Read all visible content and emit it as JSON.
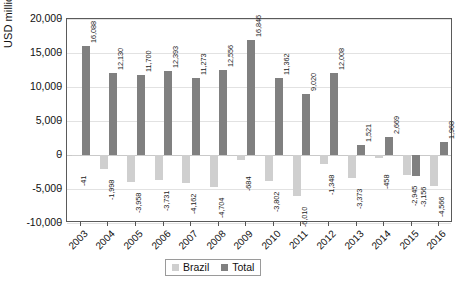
{
  "chart_data": {
    "type": "bar",
    "title": "",
    "xlabel": "",
    "ylabel": "USD millions",
    "ylim": [
      -10000,
      20000
    ],
    "yticks": [
      20000,
      15000,
      10000,
      5000,
      0,
      -5000,
      -10000
    ],
    "ytick_labels": [
      "20,000",
      "15,000",
      "10,000",
      "5,000",
      "0",
      "-5,000",
      "-10,000"
    ],
    "grid": true,
    "legend_position": "bottom-center",
    "categories": [
      "2003",
      "2004",
      "2005",
      "2006",
      "2007",
      "2008",
      "2009",
      "2010",
      "2011",
      "2012",
      "2013",
      "2014",
      "2015",
      "2016"
    ],
    "series": [
      {
        "name": "Brazil",
        "color": "#cfcfcf",
        "values": [
          -41,
          -1998,
          -3958,
          -3731,
          -4162,
          -4704,
          -684,
          -3802,
          -6010,
          -1348,
          -3373,
          -458,
          -2945,
          -4566
        ],
        "labels": [
          "-41",
          "-1,998",
          "-3,958",
          "-3,731",
          "-4,162",
          "-4,704",
          "-684",
          "-3,802",
          "-6,010",
          "-1,348",
          "-3,373",
          "-458",
          "-2,945",
          "-4,566"
        ]
      },
      {
        "name": "Total",
        "color": "#808080",
        "values": [
          16088,
          12130,
          11700,
          12393,
          11273,
          12556,
          16846,
          11362,
          9020,
          12008,
          1521,
          2669,
          -3156,
          1968
        ],
        "labels": [
          "16,088",
          "12,130",
          "11,700",
          "12,393",
          "11,273",
          "12,556",
          "16,846",
          "11,362",
          "9,020",
          "12,008",
          "1,521",
          "2,669",
          "-3,156",
          "1,968"
        ]
      }
    ]
  },
  "legend": {
    "items": [
      {
        "label": "Brazil",
        "color": "#cfcfcf"
      },
      {
        "label": "Total",
        "color": "#808080"
      }
    ]
  },
  "axes": {
    "y_title": "USD millions"
  }
}
